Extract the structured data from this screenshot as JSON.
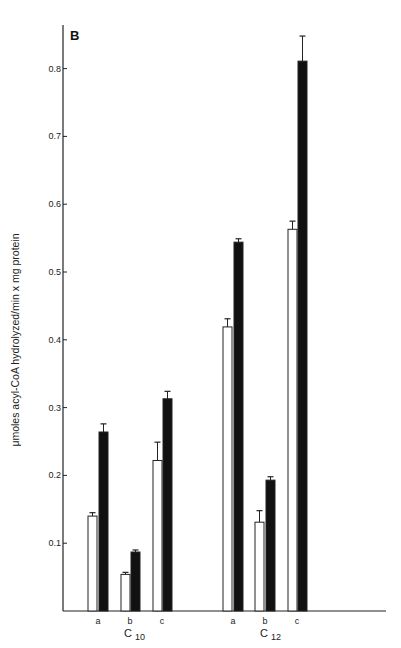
{
  "chart_data": {
    "type": "bar",
    "panel_label": "B",
    "title": "",
    "xlabel": "",
    "ylabel": "μmoles acyl-CoA hydrolyzed/min x mg protein",
    "ylim": [
      0,
      0.85
    ],
    "yticks": [
      0.1,
      0.2,
      0.3,
      0.4,
      0.5,
      0.6,
      0.7,
      0.8
    ],
    "ytick_labels": [
      "0.1",
      "0.2",
      "0.3",
      "0.4",
      "0.5",
      "0.6",
      "0.7",
      "0.8"
    ],
    "grid": false,
    "legend": null,
    "groups": [
      {
        "label": "C",
        "subscript": "10",
        "categories": [
          "a",
          "b",
          "c"
        ]
      },
      {
        "label": "C",
        "subscript": "12",
        "categories": [
          "a",
          "b",
          "c"
        ]
      }
    ],
    "categories": [
      "C10 a",
      "C10 b",
      "C10 c",
      "C12 a",
      "C12 b",
      "C12 c"
    ],
    "series": [
      {
        "name": "open bars",
        "fill": "#ffffff",
        "values": [
          0.14,
          0.054,
          0.222,
          0.419,
          0.131,
          0.563
        ],
        "error_upper": [
          0.145,
          0.057,
          0.249,
          0.431,
          0.148,
          0.575
        ]
      },
      {
        "name": "filled bars",
        "fill": "#111111",
        "values": [
          0.264,
          0.087,
          0.313,
          0.544,
          0.193,
          0.811
        ],
        "error_upper": [
          0.276,
          0.09,
          0.324,
          0.549,
          0.198,
          0.848
        ]
      }
    ]
  }
}
